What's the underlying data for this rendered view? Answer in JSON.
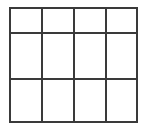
{
  "diagram": {
    "type": "grid",
    "columns": 4,
    "rows": 3,
    "line_color": "#3a3a3a",
    "background_color": "#ffffff",
    "line_width": 2,
    "x_lines": [
      10,
      42,
      74,
      106,
      137
    ],
    "y_lines": [
      8,
      33,
      79,
      122
    ]
  }
}
